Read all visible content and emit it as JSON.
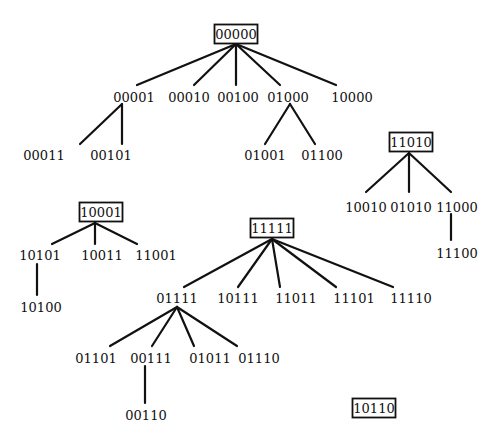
{
  "diagram": {
    "type": "forest",
    "nodes": [
      {
        "id": "00000",
        "label": "00000",
        "x": 236,
        "y": 34,
        "boxed": true
      },
      {
        "id": "00001",
        "label": "00001",
        "x": 134,
        "y": 97,
        "boxed": false
      },
      {
        "id": "00010",
        "label": "00010",
        "x": 189,
        "y": 97,
        "boxed": false
      },
      {
        "id": "00100",
        "label": "00100",
        "x": 238,
        "y": 97,
        "boxed": false
      },
      {
        "id": "01000",
        "label": "01000",
        "x": 288,
        "y": 97,
        "boxed": false
      },
      {
        "id": "10000",
        "label": "10000",
        "x": 352,
        "y": 97,
        "boxed": false
      },
      {
        "id": "00011",
        "label": "00011",
        "x": 44,
        "y": 155,
        "boxed": false
      },
      {
        "id": "00101",
        "label": "00101",
        "x": 111,
        "y": 155,
        "boxed": false
      },
      {
        "id": "01001",
        "label": "01001",
        "x": 265,
        "y": 155,
        "boxed": false
      },
      {
        "id": "01100",
        "label": "01100",
        "x": 322,
        "y": 155,
        "boxed": false
      },
      {
        "id": "11010",
        "label": "11010",
        "x": 411,
        "y": 142,
        "boxed": true
      },
      {
        "id": "10010",
        "label": "10010",
        "x": 366,
        "y": 207,
        "boxed": false
      },
      {
        "id": "01010",
        "label": "01010",
        "x": 411,
        "y": 207,
        "boxed": false
      },
      {
        "id": "11000",
        "label": "11000",
        "x": 457,
        "y": 207,
        "boxed": false
      },
      {
        "id": "11100",
        "label": "11100",
        "x": 457,
        "y": 253,
        "boxed": false
      },
      {
        "id": "10001",
        "label": "10001",
        "x": 101,
        "y": 212,
        "boxed": true
      },
      {
        "id": "10101",
        "label": "10101",
        "x": 40,
        "y": 255,
        "boxed": false
      },
      {
        "id": "10011",
        "label": "10011",
        "x": 102,
        "y": 255,
        "boxed": false
      },
      {
        "id": "11001",
        "label": "11001",
        "x": 156,
        "y": 255,
        "boxed": false
      },
      {
        "id": "10100",
        "label": "10100",
        "x": 41,
        "y": 307,
        "boxed": false
      },
      {
        "id": "11111",
        "label": "11111",
        "x": 272,
        "y": 228,
        "boxed": true
      },
      {
        "id": "01111",
        "label": "01111",
        "x": 177,
        "y": 298,
        "boxed": false
      },
      {
        "id": "10111",
        "label": "10111",
        "x": 238,
        "y": 298,
        "boxed": false
      },
      {
        "id": "11011",
        "label": "11011",
        "x": 296,
        "y": 298,
        "boxed": false
      },
      {
        "id": "11101",
        "label": "11101",
        "x": 354,
        "y": 298,
        "boxed": false
      },
      {
        "id": "11110",
        "label": "11110",
        "x": 411,
        "y": 298,
        "boxed": false
      },
      {
        "id": "01101",
        "label": "01101",
        "x": 96,
        "y": 358,
        "boxed": false
      },
      {
        "id": "00111",
        "label": "00111",
        "x": 151,
        "y": 358,
        "boxed": false
      },
      {
        "id": "01011",
        "label": "01011",
        "x": 210,
        "y": 358,
        "boxed": false
      },
      {
        "id": "01110",
        "label": "01110",
        "x": 259,
        "y": 358,
        "boxed": false
      },
      {
        "id": "00110",
        "label": "00110",
        "x": 146,
        "y": 415,
        "boxed": false
      },
      {
        "id": "10110",
        "label": "10110",
        "x": 374,
        "y": 408,
        "boxed": true
      }
    ],
    "edges": [
      {
        "from": "00000",
        "to": "00001",
        "x1": 236,
        "y1": 44,
        "x2": 137,
        "y2": 85
      },
      {
        "from": "00000",
        "to": "00010",
        "x1": 236,
        "y1": 44,
        "x2": 194,
        "y2": 85
      },
      {
        "from": "00000",
        "to": "00100",
        "x1": 236,
        "y1": 44,
        "x2": 236,
        "y2": 85
      },
      {
        "from": "00000",
        "to": "01000",
        "x1": 236,
        "y1": 44,
        "x2": 280,
        "y2": 85
      },
      {
        "from": "00000",
        "to": "10000",
        "x1": 236,
        "y1": 44,
        "x2": 336,
        "y2": 85
      },
      {
        "from": "00001",
        "to": "00011",
        "x1": 122,
        "y1": 104,
        "x2": 80,
        "y2": 144
      },
      {
        "from": "00001",
        "to": "00101",
        "x1": 122,
        "y1": 104,
        "x2": 122,
        "y2": 144
      },
      {
        "from": "01000",
        "to": "01001",
        "x1": 290,
        "y1": 104,
        "x2": 265,
        "y2": 144
      },
      {
        "from": "01000",
        "to": "01100",
        "x1": 290,
        "y1": 104,
        "x2": 315,
        "y2": 144
      },
      {
        "from": "11010",
        "to": "10010",
        "x1": 409,
        "y1": 153,
        "x2": 366,
        "y2": 192
      },
      {
        "from": "11010",
        "to": "01010",
        "x1": 409,
        "y1": 153,
        "x2": 409,
        "y2": 192
      },
      {
        "from": "11010",
        "to": "11000",
        "x1": 409,
        "y1": 153,
        "x2": 451,
        "y2": 192
      },
      {
        "from": "11000",
        "to": "11100",
        "x1": 451,
        "y1": 214,
        "x2": 451,
        "y2": 240
      },
      {
        "from": "10001",
        "to": "10101",
        "x1": 95,
        "y1": 223,
        "x2": 52,
        "y2": 244
      },
      {
        "from": "10001",
        "to": "10011",
        "x1": 95,
        "y1": 223,
        "x2": 95,
        "y2": 244
      },
      {
        "from": "10001",
        "to": "11001",
        "x1": 95,
        "y1": 223,
        "x2": 137,
        "y2": 244
      },
      {
        "from": "10101",
        "to": "10100",
        "x1": 37,
        "y1": 264,
        "x2": 37,
        "y2": 295
      },
      {
        "from": "11111",
        "to": "01111",
        "x1": 272,
        "y1": 239,
        "x2": 184,
        "y2": 287
      },
      {
        "from": "11111",
        "to": "10111",
        "x1": 272,
        "y1": 239,
        "x2": 238,
        "y2": 287
      },
      {
        "from": "11111",
        "to": "11011",
        "x1": 272,
        "y1": 239,
        "x2": 280,
        "y2": 287
      },
      {
        "from": "11111",
        "to": "11101",
        "x1": 272,
        "y1": 239,
        "x2": 336,
        "y2": 287
      },
      {
        "from": "11111",
        "to": "11110",
        "x1": 272,
        "y1": 239,
        "x2": 393,
        "y2": 287
      },
      {
        "from": "01111",
        "to": "01101",
        "x1": 177,
        "y1": 307,
        "x2": 110,
        "y2": 346
      },
      {
        "from": "01111",
        "to": "00111",
        "x1": 177,
        "y1": 307,
        "x2": 152,
        "y2": 346
      },
      {
        "from": "01111",
        "to": "01011",
        "x1": 177,
        "y1": 307,
        "x2": 194,
        "y2": 346
      },
      {
        "from": "01111",
        "to": "01110",
        "x1": 177,
        "y1": 307,
        "x2": 237,
        "y2": 346
      },
      {
        "from": "00111",
        "to": "00110",
        "x1": 145,
        "y1": 366,
        "x2": 145,
        "y2": 403
      }
    ]
  },
  "style": {
    "background": "#ffffff",
    "ink": "#111111"
  }
}
